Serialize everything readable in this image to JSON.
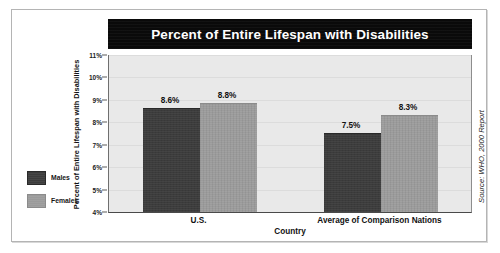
{
  "chart_data": {
    "type": "bar",
    "title": "Percent of Entire Lifespan with Disabilities",
    "xlabel": "Country",
    "ylabel": "Percent of Entire Lifespan with Disabilities",
    "categories": [
      "U.S.",
      "Average of Comparison Nations"
    ],
    "series": [
      {
        "name": "Males",
        "color": "#3c3c3c",
        "values": [
          8.6,
          7.5
        ],
        "value_labels": [
          "8.6%",
          "7.5%"
        ]
      },
      {
        "name": "Females",
        "color": "#9b9b9b",
        "values": [
          8.8,
          8.3
        ],
        "value_labels": [
          "8.8%",
          "8.3%"
        ]
      }
    ],
    "ylim": [
      4,
      11
    ],
    "ytick_values": [
      4,
      5,
      6,
      7,
      8,
      9,
      10,
      11
    ],
    "ytick_labels": [
      "4%",
      "5%",
      "6%",
      "7%",
      "8%",
      "9%",
      "10%",
      "11%"
    ],
    "grid": true,
    "legend_position": "left-outside",
    "source_note": "Source: WHO, 2000 Report",
    "plot_background": "#e9e9e9",
    "title_background": "#0a0a0a",
    "title_color": "#ffffff"
  },
  "legend": {
    "items": [
      {
        "label": "Males"
      },
      {
        "label": "Females"
      }
    ]
  }
}
